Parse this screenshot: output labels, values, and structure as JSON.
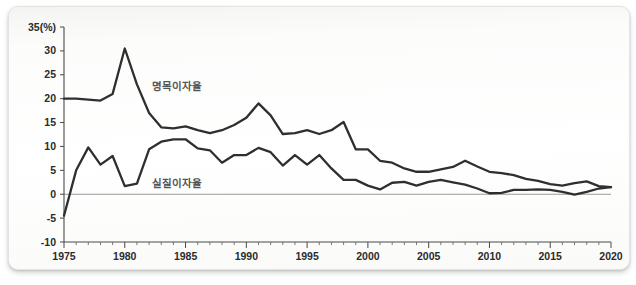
{
  "chart_data": {
    "type": "line",
    "title": "",
    "xlabel": "",
    "ylabel": "(%)",
    "unit_label": "(%)",
    "xlim": [
      1975,
      2020
    ],
    "ylim": [
      -10,
      35
    ],
    "grid": false,
    "legend_position": "inline-annotation",
    "y_ticks": [
      35,
      30,
      25,
      20,
      15,
      10,
      5,
      0,
      -5,
      -10
    ],
    "y_tick_labels": [
      "35(%)",
      "30",
      "25",
      "20",
      "15",
      "10",
      "5",
      "0",
      "-5",
      "-10"
    ],
    "x_ticks": [
      1975,
      1980,
      1985,
      1990,
      1995,
      2000,
      2005,
      2010,
      2015,
      2020
    ],
    "x_tick_labels": [
      "1975",
      "1980",
      "1985",
      "1990",
      "1995",
      "2000",
      "2005",
      "2010",
      "2015",
      "2020"
    ],
    "x_minor_tick_step": 1,
    "x": [
      1975,
      1976,
      1977,
      1978,
      1979,
      1980,
      1981,
      1982,
      1983,
      1984,
      1985,
      1986,
      1987,
      1988,
      1989,
      1990,
      1991,
      1992,
      1993,
      1994,
      1995,
      1996,
      1997,
      1998,
      1999,
      2000,
      2001,
      2002,
      2003,
      2004,
      2005,
      2006,
      2007,
      2008,
      2009,
      2010,
      2011,
      2012,
      2013,
      2014,
      2015,
      2016,
      2017,
      2018,
      2019,
      2020
    ],
    "series": [
      {
        "name": "명목이자율",
        "label_en": "nominal interest rate",
        "color": "#2f2f2f",
        "label_x": 1982.2,
        "label_y": 21.8,
        "values": [
          20.0,
          20.0,
          19.8,
          19.6,
          21.0,
          30.5,
          23.0,
          17.0,
          14.0,
          13.8,
          14.2,
          13.4,
          12.8,
          13.4,
          14.5,
          16.0,
          19.0,
          16.5,
          12.6,
          12.8,
          13.4,
          12.6,
          13.4,
          15.1,
          9.4,
          9.4,
          7.0,
          6.6,
          5.4,
          4.7,
          4.7,
          5.2,
          5.7,
          7.0,
          5.8,
          4.7,
          4.4,
          4.0,
          3.2,
          2.8,
          2.1,
          1.8,
          2.3,
          2.7,
          1.7,
          1.5
        ]
      },
      {
        "name": "실질이자율",
        "label_en": "real interest rate",
        "color": "#2f2f2f",
        "label_x": 1982.2,
        "label_y": 1.5,
        "values": [
          -4.5,
          5.0,
          9.8,
          6.2,
          8.0,
          1.7,
          2.2,
          9.4,
          11.0,
          11.5,
          11.5,
          9.6,
          9.2,
          6.6,
          8.2,
          8.2,
          9.7,
          8.8,
          6.0,
          8.2,
          6.2,
          8.2,
          5.4,
          3.0,
          3.0,
          1.8,
          1.0,
          2.4,
          2.6,
          1.8,
          2.6,
          3.0,
          2.5,
          2.0,
          1.2,
          0.2,
          0.3,
          0.9,
          0.9,
          1.0,
          0.9,
          0.5,
          -0.1,
          0.5,
          1.2,
          1.5
        ]
      }
    ]
  },
  "plot_geometry": {
    "left": 55,
    "top": 20,
    "width": 547,
    "height": 215
  }
}
